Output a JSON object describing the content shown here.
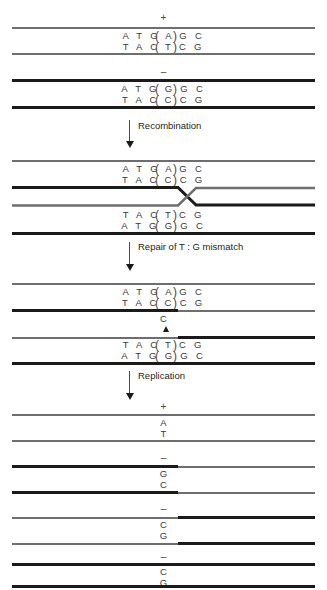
{
  "diagram": {
    "colors": {
      "gray_strand": "#6e6e6e",
      "black_strand": "#1a1a1a",
      "text": "#231f20",
      "base_text": "#3a3a3a",
      "background": "#ffffff"
    }
  },
  "steps": [
    {
      "id": "parental",
      "label": ""
    },
    {
      "id": "recombination",
      "label": "Recombination"
    },
    {
      "id": "repair",
      "label": "Repair of T : G mismatch"
    },
    {
      "id": "replication",
      "label": "Replication"
    }
  ],
  "parental": {
    "duplex_plus": {
      "sign": "+",
      "top_strand": "A T G A G C",
      "bottom_strand": "T A C T C G",
      "boxed_top": "A",
      "boxed_bottom": "T",
      "strand_color": "gray"
    },
    "duplex_minus": {
      "sign": "–",
      "top_strand": "A T G G G C",
      "bottom_strand": "T A C C C G",
      "boxed_top": "G",
      "boxed_bottom": "C",
      "strand_color": "black"
    }
  },
  "heteroduplex": {
    "upper": {
      "top_strand": "A T G A G C",
      "bottom_strand": "T A C C C G",
      "boxed_top": "A",
      "boxed_bottom": "C"
    },
    "lower": {
      "top_strand": "T A C T C G",
      "bottom_strand": "A T G G G C",
      "boxed_top": "T",
      "boxed_bottom": "G"
    },
    "junction": "crossover-x"
  },
  "repaired": {
    "upper": {
      "top_strand": "A T G A G C",
      "bottom_strand": "T A C C C G",
      "boxed_top": "A",
      "boxed_bottom": "C"
    },
    "repair_marker": {
      "base": "C",
      "arrow": "up-triangle"
    },
    "lower": {
      "top_strand": "T A C T C G",
      "bottom_strand": "A T G G G C",
      "boxed_top": "T",
      "boxed_bottom": "G"
    }
  },
  "products": [
    {
      "sign": "+",
      "top_base": "A",
      "bottom_base": "T"
    },
    {
      "sign": "–",
      "top_base": "G",
      "bottom_base": "C"
    },
    {
      "sign": "–",
      "top_base": "C",
      "bottom_base": "G"
    },
    {
      "sign": "–",
      "top_base": "C",
      "bottom_base": "G"
    }
  ]
}
